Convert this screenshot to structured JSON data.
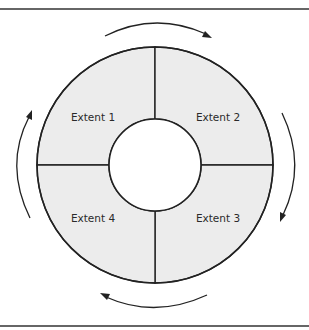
{
  "diagram": {
    "type": "cycle-ring",
    "center": [
      155,
      165
    ],
    "outer_radius": 118,
    "inner_radius": 46,
    "segment_fill": "#ececec",
    "stroke_color": "#222222",
    "segments": [
      {
        "id": "extent-1",
        "label": "Extent 1",
        "quadrant": "top-left"
      },
      {
        "id": "extent-2",
        "label": "Extent 2",
        "quadrant": "top-right"
      },
      {
        "id": "extent-3",
        "label": "Extent 3",
        "quadrant": "bottom-right"
      },
      {
        "id": "extent-4",
        "label": "Extent 4",
        "quadrant": "bottom-left"
      }
    ],
    "flow_direction": "clockwise",
    "arrows": [
      {
        "position": "top",
        "direction": "left-to-right"
      },
      {
        "position": "right",
        "direction": "top-to-bottom"
      },
      {
        "position": "bottom",
        "direction": "right-to-left"
      },
      {
        "position": "left",
        "direction": "bottom-to-top"
      }
    ]
  }
}
